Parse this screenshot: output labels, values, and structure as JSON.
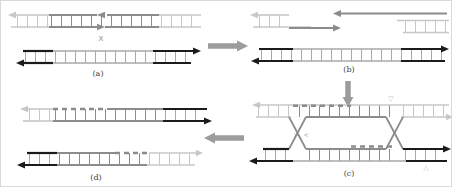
{
  "panels": {
    "a": {
      "label": "(a)",
      "nick_mark": "X"
    },
    "b": {
      "label": "(b)"
    },
    "c": {
      "label": "(c)",
      "junction_top_mark": "▽",
      "junction_bottom_mark": "△",
      "junction_left_mark_fwd": ">",
      "junction_left_mark_rev": "<"
    },
    "d": {
      "label": "(d)"
    }
  },
  "palette": {
    "strand-light": "#c7c7c7",
    "strand-mid": "#8c8c8c",
    "strand-gray": "#a9a9a9",
    "strand-dark": "#1b1b1b",
    "flow-arrow": "#9c9c9c",
    "label-color": "#3c3c3c",
    "bg": "#ffffff",
    "frame": "#d9d9d9"
  }
}
